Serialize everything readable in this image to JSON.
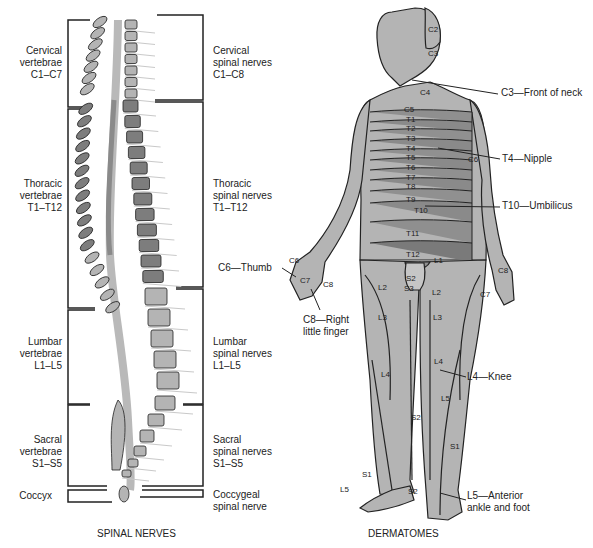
{
  "spinal_nerves": {
    "caption": "SPINAL NERVES",
    "vertebrae_groups": [
      {
        "name": "Cervical",
        "line2": "vertebrae",
        "range": "C1–C7"
      },
      {
        "name": "Thoracic",
        "line2": "vertebrae",
        "range": "T1–T12"
      },
      {
        "name": "Lumbar",
        "line2": "vertebrae",
        "range": "L1–L5"
      },
      {
        "name": "Sacral",
        "line2": "vertebrae",
        "range": "S1–S5"
      },
      {
        "name": "Coccyx"
      }
    ],
    "nerve_groups": [
      {
        "name": "Cervical",
        "line2": "spinal nerves",
        "range": "C1–C8"
      },
      {
        "name": "Thoracic",
        "line2": "spinal nerves",
        "range": "T1–T12"
      },
      {
        "name": "Lumbar",
        "line2": "spinal nerves",
        "range": "L1–L5"
      },
      {
        "name": "Sacral",
        "line2": "spinal nerves",
        "range": "S1–S5"
      },
      {
        "name": "Coccygeal",
        "line2": "spinal nerve"
      }
    ]
  },
  "dermatomes": {
    "caption": "DERMATOMES",
    "segment_labels": {
      "c2": "C2",
      "c3": "C3",
      "c4": "C4",
      "c5": "C5",
      "c6": "C6",
      "c6b": "C6",
      "c7": "C7",
      "c7b": "C7",
      "c8": "C8",
      "c8b": "C8",
      "t1": "T1",
      "t2": "T2",
      "t3": "T3",
      "t4": "T4",
      "t5": "T5",
      "t6": "T6",
      "t7": "T7",
      "t8": "T8",
      "t9": "T9",
      "t10": "T10",
      "t11": "T11",
      "t12": "T12",
      "l1": "L1",
      "l2a": "L2",
      "l2b": "L2",
      "l3a": "L3",
      "l3b": "L3",
      "l4a": "L4",
      "l4b": "L4",
      "l5a": "L5",
      "l5b": "L5",
      "s1a": "S1",
      "s1b": "S1",
      "s2a": "S2",
      "s2b": "S2",
      "s2c": "S2",
      "s3": "S3"
    },
    "callouts": {
      "neck": "C3—Front of neck",
      "nipple": "T4—Nipple",
      "umbilicus": "T10—Umbilicus",
      "thumb": "C6—Thumb",
      "finger_1": "C8—Right",
      "finger_2": "little finger",
      "knee": "L4—Knee",
      "ankle_1": "L5—Anterior",
      "ankle_2": "ankle and foot"
    }
  },
  "colors": {
    "light_gray": "#b4b4b4",
    "mid_gray": "#8f8f8f",
    "dark_gray": "#7a7a7a",
    "outline": "#222222"
  }
}
